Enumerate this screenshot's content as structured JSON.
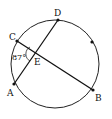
{
  "diagram": {
    "type": "circle-chords",
    "points": {
      "A": {
        "label": "A",
        "x": 14,
        "y": 84
      },
      "B": {
        "label": "B",
        "x": 93,
        "y": 90
      },
      "C": {
        "label": "C",
        "x": 17,
        "y": 41
      },
      "D": {
        "label": "D",
        "x": 58,
        "y": 20
      },
      "E": {
        "label": "E",
        "x": 36,
        "y": 54
      }
    },
    "extra_dot": {
      "x": 92,
      "y": 42
    },
    "angle_label": "87°",
    "chords": [
      "AD",
      "CB"
    ],
    "colors": {
      "stroke": "#111111",
      "background": "#ffffff"
    }
  }
}
